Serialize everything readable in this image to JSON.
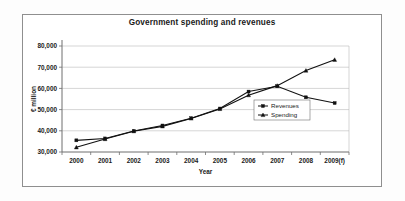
{
  "figure": {
    "background_color": "#ffffff",
    "frame_color": "#8f8f8f",
    "series_color": "#111111"
  },
  "chart_data": {
    "type": "line",
    "title": "Government spending and revenues",
    "xlabel": "Year",
    "ylabel": "€ million",
    "categories": [
      "2000",
      "2001",
      "2002",
      "2003",
      "2004",
      "2005",
      "2006",
      "2007",
      "2008",
      "2009(f)"
    ],
    "ylim": [
      30000,
      80000
    ],
    "ytick_labels": [
      "30,000",
      "40,000",
      "50,000",
      "60,000",
      "70,000",
      "80,000"
    ],
    "ytick_values": [
      30000,
      40000,
      50000,
      60000,
      70000,
      80000
    ],
    "grid": true,
    "legend_position": "center-right-inside",
    "series": [
      {
        "name": "Revenues",
        "marker": "square",
        "values": [
          35500,
          36400,
          39900,
          42500,
          45900,
          50500,
          58500,
          61000,
          55800,
          53100
        ]
      },
      {
        "name": "Spending",
        "marker": "triangle",
        "values": [
          32200,
          36100,
          39800,
          42100,
          45800,
          50300,
          56800,
          61300,
          68400,
          73500
        ]
      }
    ]
  },
  "legend": {
    "entries": [
      {
        "label": "Revenues"
      },
      {
        "label": "Spending"
      }
    ]
  }
}
